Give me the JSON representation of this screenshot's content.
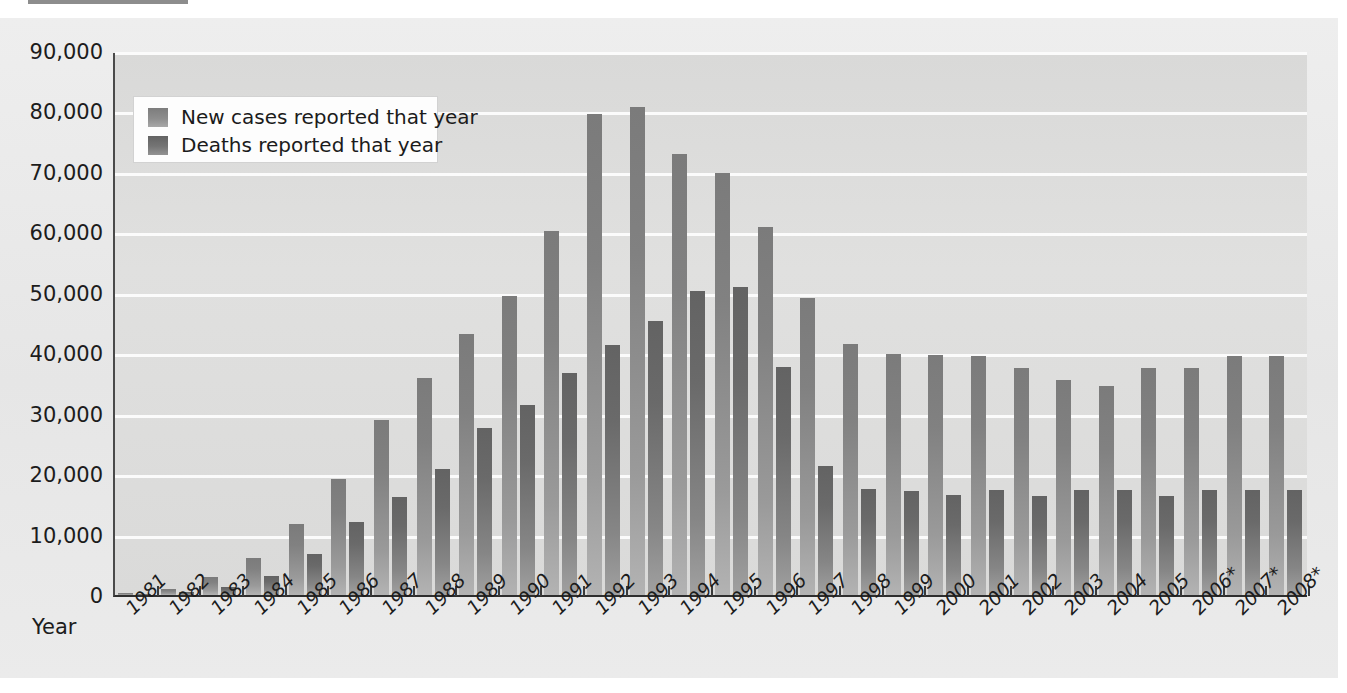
{
  "chart_data": {
    "type": "bar",
    "title": "The Rise of AIDS in the United States",
    "xlabel": "Year",
    "ylabel": "",
    "ylim": [
      0,
      90000
    ],
    "ytick_step": 10000,
    "yticks": [
      "0",
      "10,000",
      "20,000",
      "30,000",
      "40,000",
      "50,000",
      "60,000",
      "70,000",
      "80,000",
      "90,000"
    ],
    "grid": true,
    "legend_position": "top-left",
    "footnote_marker": "*",
    "categories": [
      "1981",
      "1982",
      "1983",
      "1984",
      "1985",
      "1986",
      "1987",
      "1988",
      "1989",
      "1990",
      "1991",
      "1992",
      "1993",
      "1994",
      "1995",
      "1996",
      "1997",
      "1998",
      "1999",
      "2000",
      "2001",
      "2002",
      "2003",
      "2004",
      "2005",
      "2006*",
      "2007*",
      "2008*"
    ],
    "series": [
      {
        "name": "New cases reported that year",
        "color": "#8d8d8d",
        "values": [
          300,
          1000,
          2900,
          6200,
          11800,
          19200,
          28900,
          35900,
          43200,
          49400,
          60300,
          79500,
          80800,
          73000,
          69800,
          60900,
          49100,
          41500,
          39800,
          39700,
          39600,
          37500,
          35600,
          34500,
          37500,
          37600,
          39600,
          39600
        ]
      },
      {
        "name": "Deaths reported that year",
        "color": "#6e6e6e",
        "values": [
          130,
          450,
          1400,
          3100,
          6800,
          12000,
          16200,
          20800,
          27700,
          31500,
          36800,
          41400,
          45400,
          50300,
          51000,
          37800,
          21300,
          17600,
          17200,
          16500,
          17400,
          16400,
          17400,
          17400,
          16400,
          17400,
          17300,
          17300
        ]
      }
    ]
  }
}
